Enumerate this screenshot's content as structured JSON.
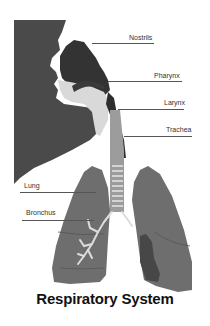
{
  "diagram": {
    "title": "Respiratory System",
    "labels": [
      {
        "id": "nostrils",
        "text": "Nostrils"
      },
      {
        "id": "pharynx",
        "text": "Pharynx"
      },
      {
        "id": "larynx",
        "text": "Larynx"
      },
      {
        "id": "trachea",
        "text": "Trachea"
      },
      {
        "id": "lung",
        "text": "Lung"
      },
      {
        "id": "bronchus",
        "text": "Bronchus"
      }
    ],
    "colors": {
      "background_dark": "#4a4a4a",
      "nasal_cavity": "#3a3a3a",
      "airway_light": "#d8d8d8",
      "trachea": "#9a9a9a",
      "lung": "#6e6e6e",
      "lung_dark": "#474747",
      "bronchus": "#dcdcdc"
    }
  }
}
